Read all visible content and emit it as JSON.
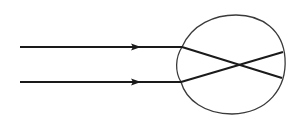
{
  "diagram": {
    "colors": {
      "background": "#ffffff",
      "ray": "#1a1a1a",
      "eyeball": "#3a3a3a"
    },
    "rays": [
      {
        "name": "upper-ray",
        "start": [
          20,
          47
        ],
        "entry": [
          182,
          47
        ],
        "end": [
          283,
          52
        ],
        "arrow_tip": [
          141,
          47
        ]
      },
      {
        "name": "lower-ray",
        "start": [
          20,
          82
        ],
        "entry": [
          181,
          82
        ],
        "end": [
          282,
          78
        ],
        "arrow_tip": [
          141,
          82
        ]
      }
    ],
    "crossing_point": [
      237,
      65
    ],
    "eyeball": {
      "left": 176,
      "right": 285,
      "top": 15,
      "bottom": 114
    },
    "labels": []
  }
}
